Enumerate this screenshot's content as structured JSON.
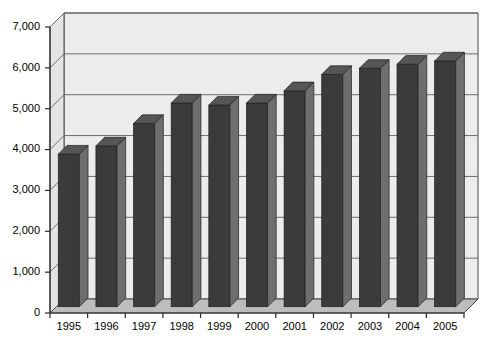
{
  "chart_data": {
    "type": "bar",
    "title": "",
    "subtitle": "",
    "xlabel": "",
    "ylabel": "",
    "categories": [
      "1995",
      "1996",
      "1997",
      "1998",
      "1999",
      "2000",
      "2001",
      "2002",
      "2003",
      "2004",
      "2005"
    ],
    "values": [
      3700,
      3900,
      4450,
      4950,
      4900,
      4950,
      5250,
      5650,
      5800,
      5900,
      5980
    ],
    "series": [
      {
        "name": "",
        "values": [
          3700,
          3900,
          4450,
          4950,
          4900,
          4950,
          5250,
          5650,
          5800,
          5900,
          5980
        ]
      }
    ],
    "ylim": [
      0,
      7000
    ],
    "ytick_values": [
      0,
      1000,
      2000,
      3000,
      4000,
      5000,
      6000,
      7000
    ],
    "ytick_labels": [
      "0",
      "1,000",
      "2,000",
      "3,000",
      "4,000",
      "5,000",
      "6,000",
      "7,000"
    ],
    "xtick_labels": [
      "1995",
      "1996",
      "1997",
      "1998",
      "1999",
      "2000",
      "2001",
      "2002",
      "2003",
      "2004",
      "2005"
    ],
    "grid": true,
    "grid_axis": "y",
    "legend": false,
    "legend_position": "none",
    "annotations": [],
    "style": "3d-column",
    "colors": {
      "bar_front": "#3b3b3b",
      "bar_side": "#6e6e6e",
      "bar_top": "#555555",
      "plot_background": "#ececec",
      "floor": "#bdbdbd",
      "wall_left": "#e3e3e3",
      "gridline": "#6d6d6d",
      "axis_line": "#2b2b2b",
      "text": "#000000"
    }
  },
  "axes": {
    "y_axis_name": "value-axis",
    "x_axis_name": "year-axis"
  }
}
